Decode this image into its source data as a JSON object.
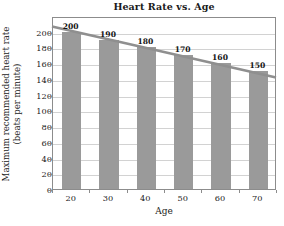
{
  "chart_data": {
    "type": "bar",
    "title": "Heart Rate vs. Age",
    "xlabel": "Age",
    "ylabel_lines": [
      "Maximum recommended heart rate",
      "(beats per minute)"
    ],
    "categories": [
      "20",
      "30",
      "40",
      "50",
      "60",
      "70"
    ],
    "values": [
      200,
      190,
      180,
      170,
      160,
      150
    ],
    "data_labels": [
      "200",
      "190",
      "180",
      "170",
      "160",
      "150"
    ],
    "ylim": [
      0,
      220
    ],
    "y_ticks": [
      "0",
      "20",
      "40",
      "60",
      "80",
      "100",
      "120",
      "140",
      "160",
      "180",
      "200"
    ],
    "y_tick_values": [
      0,
      20,
      40,
      60,
      80,
      100,
      120,
      140,
      160,
      180,
      200
    ],
    "grid": "horizontal",
    "legend": "none",
    "series": [
      {
        "name": "Maximum recommended heart rate",
        "type": "bar",
        "values": [
          200,
          190,
          180,
          170,
          160,
          150
        ],
        "color": "#9a9a9a"
      },
      {
        "name": "trend line",
        "type": "line",
        "x": [
          15,
          75
        ],
        "y": [
          208,
          143
        ],
        "color": "#8f8f8f"
      }
    ],
    "x_axis_range": [
      15,
      75
    ],
    "bar_color": "#9a9a9a",
    "line_color": "#8f8f8f",
    "frame_color": "#8c8c8c",
    "gridline_color": "#d2d2d2",
    "background": "#ffffff"
  },
  "footer": {
    "artifact_text": ""
  }
}
